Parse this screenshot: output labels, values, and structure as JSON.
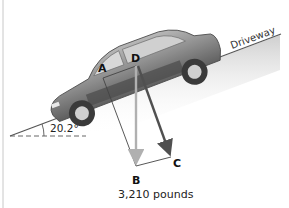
{
  "figure": {
    "driveway_label": "Driveway",
    "angle_label": "20.2°",
    "angle_degrees": 20.2,
    "weight_label": "3,210 pounds",
    "points": {
      "A": "A",
      "B": "B",
      "C": "C",
      "D": "D"
    },
    "colors": {
      "car_body": "#8a8a8a",
      "weight_vector": "#b5b5b5",
      "component_vector": "#555555",
      "construction_line": "#444444",
      "ground_shade": "#d9d9d9"
    }
  }
}
